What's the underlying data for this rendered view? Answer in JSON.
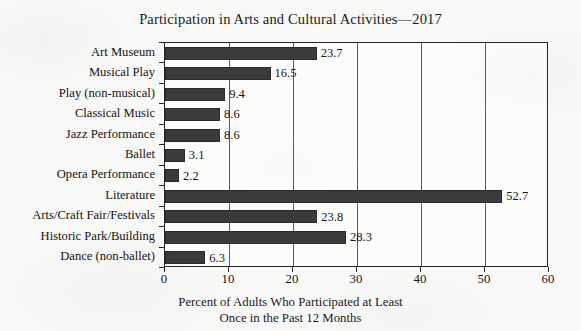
{
  "chart_data": {
    "type": "bar",
    "orientation": "horizontal",
    "title": "Participation in Arts and Cultural Activities—2017",
    "xlabel_line1": "Percent of Adults Who Participated at Least",
    "xlabel_line2": "Once in the Past 12 Months",
    "ylabel": "",
    "categories": [
      "Art Museum",
      "Musical Play",
      "Play (non-musical)",
      "Classical Music",
      "Jazz Performance",
      "Ballet",
      "Opera Performance",
      "Literature",
      "Arts/Craft Fair/Festivals",
      "Historic Park/Building",
      "Dance (non-ballet)"
    ],
    "values": [
      23.7,
      16.5,
      9.4,
      8.6,
      8.6,
      3.1,
      2.2,
      52.7,
      23.8,
      28.3,
      6.3
    ],
    "value_labels": [
      "23.7",
      "16.5",
      "9.4",
      "8.6",
      "8.6",
      "3.1",
      "2.2",
      "52.7",
      "23.8",
      "28.3",
      "6.3"
    ],
    "xlim": [
      0,
      60
    ],
    "xticks": [
      0,
      10,
      20,
      30,
      40,
      50,
      60
    ],
    "xtick_labels": [
      "0",
      "10",
      "20",
      "30",
      "40",
      "50",
      "60"
    ],
    "grid": "vertical",
    "legend": "none",
    "bar_color": "#3b3b3b",
    "axis_color": "#242424",
    "gridline_color": "#5c5c5c",
    "background_color": "#f8f8f7",
    "plot_background_color": "#fcfcfb"
  }
}
